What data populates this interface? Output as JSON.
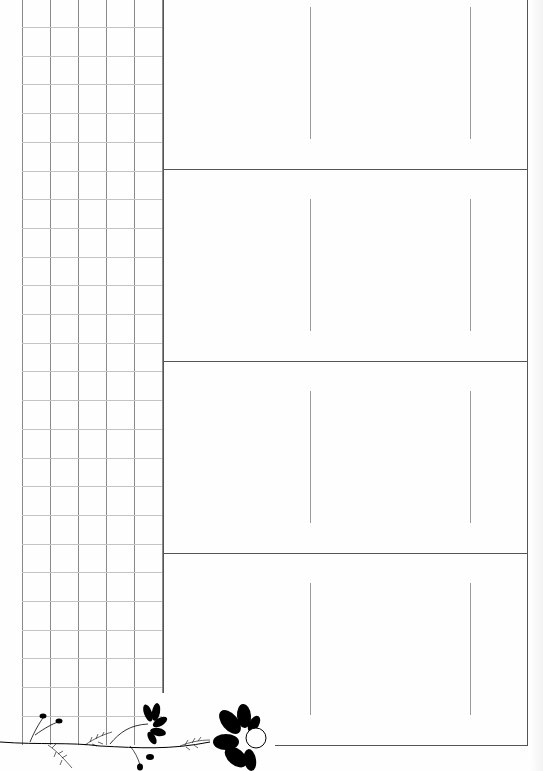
{
  "page": {
    "type": "planner-sheet",
    "background": "#fefefe",
    "grid": {
      "columns": 5,
      "rows": 25,
      "line_color": "#8a8a8a",
      "row_line_color": "#c4c4c4"
    },
    "panels": {
      "count": 4,
      "border_color": "#555555",
      "inner_lines_per_panel": 2
    },
    "decoration": {
      "name": "black-floral-vine",
      "color": "#000000"
    }
  }
}
